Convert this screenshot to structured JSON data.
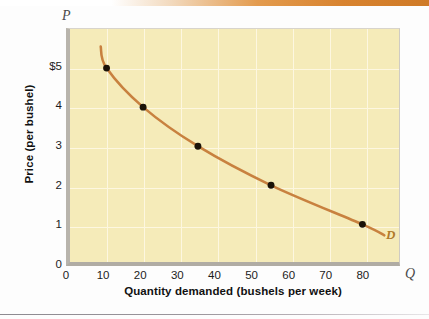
{
  "figure": {
    "background_color": "#fdfdfd",
    "plot_background_color": "#f5ebb9",
    "top_band_color": "#cf7a27"
  },
  "axes": {
    "p_letter": "P",
    "q_letter": "Q",
    "y_label": "Price (per bushel)",
    "x_label": "Quantity demanded (bushels per week)"
  },
  "chart_data": {
    "type": "line",
    "title": "",
    "subtitle": "",
    "xlabel": "Quantity demanded (bushels per week)",
    "ylabel": "Price (per bushel)",
    "x_axis_symbol": "Q",
    "y_axis_symbol": "P",
    "xlim": [
      0,
      90
    ],
    "ylim": [
      0,
      6
    ],
    "xticks": [
      0,
      10,
      20,
      30,
      40,
      50,
      60,
      70,
      80
    ],
    "xtick_labels": [
      "0",
      "10",
      "20",
      "30",
      "40",
      "50",
      "60",
      "70",
      "80"
    ],
    "yticks": [
      0,
      1,
      2,
      3,
      4,
      5
    ],
    "ytick_labels": [
      "0",
      "1",
      "2",
      "3",
      "4",
      "$5"
    ],
    "grid": true,
    "grid_color": "#fdf7e0",
    "legend": "none",
    "series": [
      {
        "name": "D",
        "label": "D",
        "annotation": "D",
        "color": "#c8813f",
        "marker_color": "#1a1208",
        "x": [
          10,
          20,
          35,
          55,
          80
        ],
        "y": [
          5,
          4,
          3,
          2,
          1
        ],
        "points": [
          {
            "q": 10,
            "p": 5
          },
          {
            "q": 20,
            "p": 4
          },
          {
            "q": 35,
            "p": 3
          },
          {
            "q": 55,
            "p": 2
          },
          {
            "q": 80,
            "p": 1
          }
        ]
      }
    ],
    "curve_extends_beyond_endpoints": true
  }
}
